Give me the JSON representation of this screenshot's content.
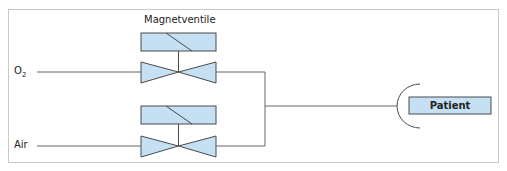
{
  "diagram": {
    "title": "Magnetventile",
    "inputs": [
      {
        "label": "O",
        "subscript": "2"
      },
      {
        "label": "Air"
      }
    ],
    "output": {
      "label": "Patient"
    },
    "colors": {
      "fill": "#c5e0f2",
      "stroke": "#4a4a4a",
      "line": "#666666",
      "frame": "#c9c9c9"
    }
  }
}
